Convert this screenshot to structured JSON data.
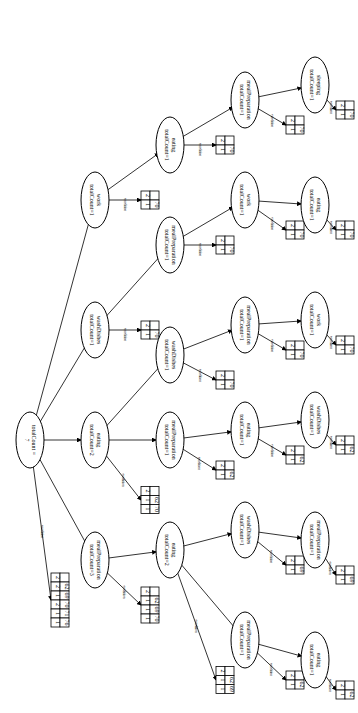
{
  "diagram": {
    "orientation": "rotated-90",
    "edge_label": "condition",
    "nodes": [
      {
        "id": "root",
        "line1": "totalCount =",
        "line2": "7",
        "x": 30,
        "y": 440
      },
      {
        "id": "n_mp",
        "line1": "mealPreparation",
        "line2": "totalCount=3",
        "x": 95,
        "y": 560
      },
      {
        "id": "n_eat2",
        "line1": "eating",
        "line2": "totalCount=2",
        "x": 95,
        "y": 440
      },
      {
        "id": "n_wash1",
        "line1": "washDishes",
        "line2": "totalCount=1",
        "x": 95,
        "y": 330
      },
      {
        "id": "n_work1",
        "line1": "work",
        "line2": "totalCount=1",
        "x": 95,
        "y": 200
      },
      {
        "id": "n_eat_mp",
        "line1": "eating",
        "line2": "totalCount=2",
        "x": 170,
        "y": 550
      },
      {
        "id": "n_mp_e",
        "line1": "mealPreparation",
        "line2": "totalCount=1",
        "x": 170,
        "y": 440
      },
      {
        "id": "n_wash_e",
        "line1": "washDishes",
        "line2": "totalCount=1",
        "x": 170,
        "y": 355
      },
      {
        "id": "n_mp_w",
        "line1": "mealPreparation",
        "line2": "totalCount=1",
        "x": 170,
        "y": 245
      },
      {
        "id": "n_eat_w",
        "line1": "eating",
        "line2": "totalCount=1",
        "x": 170,
        "y": 145
      },
      {
        "id": "n_mp_em",
        "line1": "mealPreparation",
        "line2": "totalCount=1",
        "x": 245,
        "y": 640
      },
      {
        "id": "n_wash_em",
        "line1": "washDishes",
        "line2": "totalCount=1",
        "x": 245,
        "y": 530
      },
      {
        "id": "n_eat_me",
        "line1": "eating",
        "line2": "totalCount=1",
        "x": 245,
        "y": 430
      },
      {
        "id": "n_mp_we",
        "line1": "mealPreparation",
        "line2": "totalCount=1",
        "x": 245,
        "y": 325
      },
      {
        "id": "n_work_mw",
        "line1": "work",
        "line2": "totalCount=1",
        "x": 245,
        "y": 200
      },
      {
        "id": "n_mp_ew",
        "line1": "mealPreparation",
        "line2": "totalCount=1",
        "x": 245,
        "y": 100
      },
      {
        "id": "n_eat_mem",
        "line1": "eating",
        "line2": "totalCount=1",
        "x": 315,
        "y": 660
      },
      {
        "id": "n_mp_wem",
        "line1": "mealPreparation",
        "line2": "totalCount=1",
        "x": 315,
        "y": 540
      },
      {
        "id": "n_wash_eme",
        "line1": "washDishes",
        "line2": "totalCount=1",
        "x": 315,
        "y": 420
      },
      {
        "id": "n_work_mwe",
        "line1": "work",
        "line2": "totalCount=1",
        "x": 315,
        "y": 320
      },
      {
        "id": "n_eat_wmw",
        "line1": "eating",
        "line2": "totalCount=1",
        "x": 315,
        "y": 205
      },
      {
        "id": "n_sleep",
        "line1": "sleeping",
        "line2": "totalCount=1",
        "x": 315,
        "y": 85
      }
    ],
    "edges": [
      [
        "root",
        "n_mp"
      ],
      [
        "root",
        "n_eat2"
      ],
      [
        "root",
        "n_wash1"
      ],
      [
        "root",
        "n_work1"
      ],
      [
        "n_mp",
        "n_eat_mp"
      ],
      [
        "n_eat2",
        "n_mp_e"
      ],
      [
        "n_eat2",
        "n_wash_e"
      ],
      [
        "n_wash1",
        "n_mp_w"
      ],
      [
        "n_work1",
        "n_eat_w"
      ],
      [
        "n_eat_mp",
        "n_mp_em"
      ],
      [
        "n_eat_mp",
        "n_wash_em"
      ],
      [
        "n_mp_e",
        "n_eat_me"
      ],
      [
        "n_wash_e",
        "n_mp_we"
      ],
      [
        "n_mp_w",
        "n_work_mw"
      ],
      [
        "n_eat_w",
        "n_mp_ew"
      ],
      [
        "n_mp_em",
        "n_eat_mem"
      ],
      [
        "n_wash_em",
        "n_mp_wem"
      ],
      [
        "n_eat_me",
        "n_wash_eme"
      ],
      [
        "n_mp_we",
        "n_work_mwe"
      ],
      [
        "n_work_mw",
        "n_eat_wmw"
      ],
      [
        "n_mp_ew",
        "n_sleep"
      ]
    ],
    "tables": [
      {
        "parent": "root",
        "x": 60,
        "y": 600,
        "rows": [
          [
            "2",
            ""
          ],
          [
            "2",
            "62"
          ],
          [
            "1",
            "69"
          ],
          [
            "2",
            "70"
          ],
          [
            "1",
            "71"
          ],
          [
            "1",
            "76"
          ]
        ]
      },
      {
        "parent": "n_mp",
        "x": 150,
        "y": 605,
        "rows": [
          [
            "2",
            ""
          ],
          [
            "1",
            "62"
          ],
          [
            "1",
            "69"
          ],
          [
            "1",
            "70"
          ]
        ]
      },
      {
        "parent": "n_eat2",
        "x": 150,
        "y": 500,
        "rows": [
          [
            "2",
            ""
          ],
          [
            "1",
            "62"
          ],
          [
            "1",
            "70"
          ]
        ]
      },
      {
        "parent": "n_wash1",
        "x": 150,
        "y": 330,
        "rows": [
          [
            "2",
            ""
          ],
          [
            "1",
            "70"
          ]
        ]
      },
      {
        "parent": "n_work1",
        "x": 150,
        "y": 200,
        "rows": [
          [
            "2",
            ""
          ],
          [
            "1",
            "70"
          ]
        ]
      },
      {
        "parent": "n_eat_mp",
        "x": 225,
        "y": 680,
        "rows": [
          [
            "2",
            ""
          ],
          [
            "1",
            "62"
          ],
          [
            "1",
            "69"
          ]
        ]
      },
      {
        "parent": "n_mp_e",
        "x": 225,
        "y": 470,
        "rows": [
          [
            "2",
            ""
          ],
          [
            "1",
            "62"
          ]
        ]
      },
      {
        "parent": "n_wash_e",
        "x": 225,
        "y": 380,
        "rows": [
          [
            "2",
            ""
          ],
          [
            "1",
            "70"
          ]
        ]
      },
      {
        "parent": "n_mp_w",
        "x": 225,
        "y": 245,
        "rows": [
          [
            "2",
            ""
          ],
          [
            "1",
            "70"
          ]
        ]
      },
      {
        "parent": "n_eat_w",
        "x": 225,
        "y": 145,
        "rows": [
          [
            "2",
            ""
          ],
          [
            "1",
            "70"
          ]
        ]
      },
      {
        "parent": "n_mp_em",
        "x": 295,
        "y": 680,
        "rows": [
          [
            "2",
            ""
          ],
          [
            "1",
            "62"
          ]
        ]
      },
      {
        "parent": "n_wash_em",
        "x": 295,
        "y": 565,
        "rows": [
          [
            "2",
            ""
          ],
          [
            "1",
            "69"
          ]
        ]
      },
      {
        "parent": "n_eat_me",
        "x": 295,
        "y": 455,
        "rows": [
          [
            "2",
            ""
          ],
          [
            "1",
            "62"
          ]
        ]
      },
      {
        "parent": "n_mp_we",
        "x": 295,
        "y": 350,
        "rows": [
          [
            "2",
            ""
          ],
          [
            "1",
            "70"
          ]
        ]
      },
      {
        "parent": "n_work_mw",
        "x": 295,
        "y": 230,
        "rows": [
          [
            "2",
            ""
          ],
          [
            "1",
            "70"
          ]
        ]
      },
      {
        "parent": "n_mp_ew",
        "x": 295,
        "y": 125,
        "rows": [
          [
            "2",
            ""
          ],
          [
            "1",
            "70"
          ]
        ]
      },
      {
        "parent": "n_eat_mem",
        "x": 345,
        "y": 690,
        "rows": [
          [
            "2",
            ""
          ],
          [
            "1",
            "62"
          ]
        ]
      },
      {
        "parent": "n_mp_wem",
        "x": 345,
        "y": 575,
        "rows": [
          [
            "2",
            ""
          ],
          [
            "1",
            "69"
          ]
        ]
      },
      {
        "parent": "n_wash_eme",
        "x": 345,
        "y": 445,
        "rows": [
          [
            "2",
            ""
          ],
          [
            "1",
            "62"
          ]
        ]
      },
      {
        "parent": "n_work_mwe",
        "x": 345,
        "y": 345,
        "rows": [
          [
            "2",
            ""
          ],
          [
            "1",
            "70"
          ]
        ]
      },
      {
        "parent": "n_eat_wmw",
        "x": 345,
        "y": 230,
        "rows": [
          [
            "2",
            ""
          ],
          [
            "1",
            "70"
          ]
        ]
      },
      {
        "parent": "n_sleep",
        "x": 345,
        "y": 110,
        "rows": [
          [
            "2",
            ""
          ],
          [
            "1",
            "70"
          ]
        ]
      }
    ]
  }
}
